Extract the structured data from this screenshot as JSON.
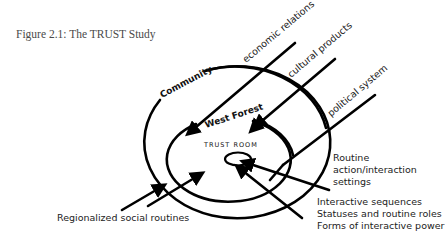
{
  "caption": "Figure 2.1:  The TRUST Study",
  "rings": {
    "outer": "Community",
    "middle": "West Forest",
    "inner": "TRUST ROOM"
  },
  "external_influences": {
    "economic": "economic relations",
    "cultural": "cultural products",
    "political": "political system"
  },
  "labels": {
    "regional": "Regionalized social routines",
    "routine_line1": "Routine",
    "routine_line2": "action/interaction",
    "routine_line3": "settings",
    "interactive_line1": "Interactive sequences",
    "interactive_line2": "Statuses and routine roles",
    "interactive_line3": "Forms of interactive power"
  }
}
